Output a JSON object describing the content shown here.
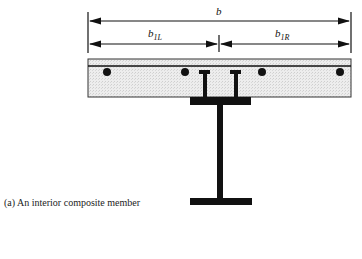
{
  "figure": {
    "caption": "(a) An interior composite member",
    "dimensions": {
      "total_width_label": "b",
      "left_width_label": "b",
      "left_width_sub": "1L",
      "right_width_label": "b",
      "right_width_sub": "1R"
    },
    "components": [
      "concrete slab",
      "reinforcing bars",
      "shear connectors",
      "steel I-beam"
    ],
    "colors": {
      "line": "#111111",
      "slab_fill": "#e8e8e8"
    }
  }
}
